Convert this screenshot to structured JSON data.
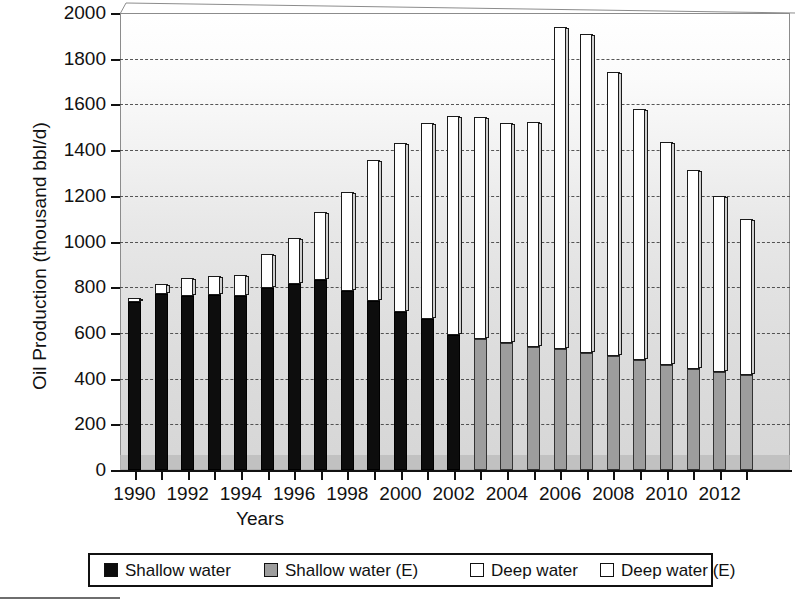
{
  "chart": {
    "type": "bar",
    "title": "",
    "ylabel": "Oil Production (thousand bbl/d)",
    "xlabel": "Years",
    "ylim": [
      0,
      2000
    ],
    "ytick_step": 200,
    "yticks": [
      "0",
      "200",
      "400",
      "600",
      "800",
      "1000",
      "1200",
      "1400",
      "1600",
      "1800",
      "2000"
    ],
    "xticks_visible": [
      "1990",
      "1992",
      "1994",
      "1996",
      "1998",
      "2000",
      "2002",
      "2004",
      "2006",
      "2008",
      "2010",
      "2012"
    ],
    "grid": "horizontal-dashed",
    "legend_position": "below-plot"
  },
  "legend": {
    "items": [
      {
        "label": "Shallow water",
        "swatch": "black",
        "color": "#0d0d0d"
      },
      {
        "label": "Shallow water (E)",
        "swatch": "gray",
        "color": "#9d9d9d"
      },
      {
        "label": "Deep water",
        "swatch": "white",
        "color": "#ffffff"
      },
      {
        "label": "Deep water (E)",
        "swatch": "white",
        "color": "#ffffff"
      }
    ]
  },
  "chart_data": {
    "type": "bar",
    "stacked": true,
    "title": "",
    "xlabel": "Years",
    "ylabel": "Oil Production (thousand bbl/d)",
    "ylim": [
      0,
      2000
    ],
    "ytick_step": 200,
    "grid": true,
    "legend_position": "bottom",
    "categories": [
      "1990",
      "1991",
      "1992",
      "1993",
      "1994",
      "1995",
      "1996",
      "1997",
      "1998",
      "1999",
      "2000",
      "2001",
      "2002",
      "2003",
      "2004",
      "2005",
      "2006",
      "2007",
      "2008",
      "2009",
      "2010",
      "2011",
      "2012",
      "2013"
    ],
    "series": [
      {
        "name": "Shallow water",
        "color": "#0d0d0d",
        "values": [
          735,
          770,
          760,
          765,
          760,
          795,
          815,
          830,
          785,
          740,
          690,
          660,
          590,
          null,
          null,
          null,
          null,
          null,
          null,
          null,
          null,
          null,
          null,
          null
        ]
      },
      {
        "name": "Shallow water (E)",
        "color": "#9d9d9d",
        "values": [
          null,
          null,
          null,
          null,
          null,
          null,
          null,
          null,
          null,
          null,
          null,
          null,
          null,
          575,
          555,
          540,
          530,
          510,
          500,
          480,
          460,
          440,
          430,
          415
        ]
      },
      {
        "name": "Deep water",
        "color": "#ffffff",
        "values": [
          20,
          45,
          80,
          85,
          95,
          150,
          200,
          300,
          430,
          615,
          740,
          860,
          960,
          null,
          null,
          null,
          null,
          null,
          null,
          null,
          null,
          null,
          null,
          null
        ]
      },
      {
        "name": "Deep water (E)",
        "color": "#ffffff",
        "values": [
          null,
          null,
          null,
          null,
          null,
          null,
          null,
          null,
          null,
          null,
          null,
          null,
          null,
          970,
          965,
          985,
          1410,
          1400,
          1240,
          1100,
          975,
          875,
          770,
          685
        ]
      }
    ],
    "totals": [
      755,
      815,
      840,
      850,
      855,
      945,
      1015,
      1130,
      1215,
      1355,
      1430,
      1520,
      1550,
      1545,
      1520,
      1525,
      1940,
      1910,
      1740,
      1580,
      1435,
      1315,
      1200,
      1100
    ]
  }
}
